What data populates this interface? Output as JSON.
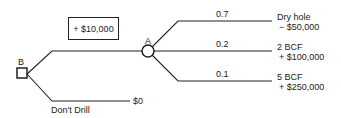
{
  "diagram": {
    "type": "decision-tree",
    "decision_node": {
      "label": "B",
      "shape": "square"
    },
    "chance_node": {
      "label": "A",
      "shape": "circle"
    },
    "drill_cost_box": "+ $10,000",
    "dont_drill": {
      "label": "Don't Drill",
      "payoff": "$0"
    },
    "outcomes": [
      {
        "probability": "0.7",
        "name": "Dry hole",
        "payoff": "− $50,000"
      },
      {
        "probability": "0.2",
        "name": "2 BCF",
        "payoff": "+ $100,000"
      },
      {
        "probability": "0.1",
        "name": "5 BCF",
        "payoff": "+ $250,000"
      }
    ],
    "colors": {
      "line": "#222222",
      "background": "#ffffff"
    }
  }
}
